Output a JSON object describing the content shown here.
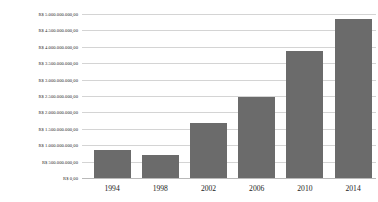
{
  "chart_data": {
    "type": "bar",
    "title": "",
    "subtitle": "",
    "xlabel": "",
    "ylabel": "",
    "categories": [
      "1994",
      "1998",
      "2002",
      "2006",
      "2010",
      "2014"
    ],
    "values": [
      850000000,
      700000000,
      1680000000,
      2470000000,
      3870000000,
      4850000000
    ],
    "series": [
      {
        "name": "",
        "values": [
          850000000,
          700000000,
          1680000000,
          2470000000,
          3870000000,
          4850000000
        ]
      }
    ],
    "ylim": [
      0,
      5000000000
    ],
    "ytick_values": [
      0,
      500000000,
      1000000000,
      1500000000,
      2000000000,
      2500000000,
      3000000000,
      3500000000,
      4000000000,
      4500000000,
      5000000000
    ],
    "ytick_labels": [
      "R$ 0,00",
      "R$ 500.000.000,00",
      "R$ 1.000.000.000,00",
      "R$ 1.500.000.000,00",
      "R$ 2.000.000.000,00",
      "R$ 2.500.000.000,00",
      "R$ 3.000.000.000,00",
      "R$ 3.500.000.000,00",
      "R$ 4.000.000.000,00",
      "R$ 4.500.000.000,00",
      "R$ 5.000.000.000,00"
    ],
    "xtick_labels": [
      "1994",
      "1998",
      "2002",
      "2006",
      "2010",
      "2014"
    ],
    "grid": true,
    "grid_axis": "y",
    "legend": false,
    "legend_position": "none",
    "annotations": [],
    "bar_color": "#6b6b6b",
    "gridline_color": "#d4d4d4",
    "background_color": "#ffffff",
    "text_color": "#2c2c2c",
    "currency_symbol": "R$"
  }
}
